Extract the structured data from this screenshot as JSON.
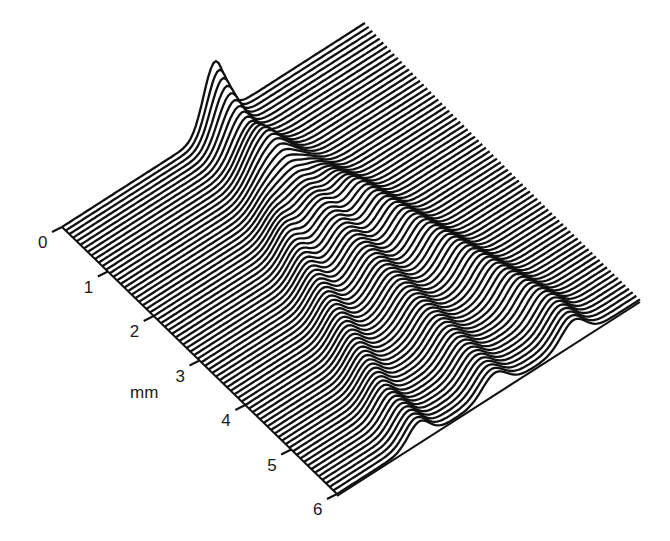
{
  "chart_data": {
    "type": "waterfall-3d",
    "title": "",
    "axis": {
      "label": "mm",
      "ticks": [
        "0",
        "1",
        "2",
        "3",
        "4",
        "5",
        "6"
      ],
      "range": [
        0,
        6
      ]
    },
    "traces": {
      "count": 76,
      "line_color": "#111111",
      "fill_color": "#ffffff"
    },
    "features": [
      {
        "name": "initial-peak",
        "position_mm": 0,
        "relative_u": 0.5,
        "relative_height": 1.0
      },
      {
        "name": "ridge-left",
        "end_mm": 6,
        "end_u": 0.27,
        "relative_height": 0.33
      },
      {
        "name": "ridge-center",
        "end_mm": 6,
        "end_u": 0.5,
        "relative_height": 0.33
      },
      {
        "name": "ridge-right",
        "end_mm": 6,
        "end_u": 0.78,
        "relative_height": 0.38
      }
    ],
    "geometry": {
      "origin": [
        62,
        227
      ],
      "u_vector": [
        303,
        -194
      ],
      "v_vector": [
        275,
        267
      ]
    },
    "grid": false,
    "legend": null
  }
}
